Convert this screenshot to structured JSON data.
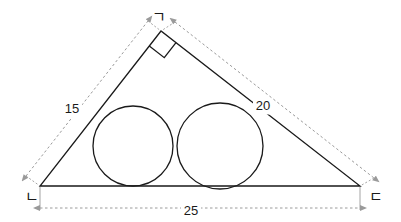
{
  "figure": {
    "kind": "geometry-diagram",
    "background_color": "#ffffff",
    "stroke_color": "#1a1a1a",
    "dimension_color": "#9a9a9a",
    "label_color": "#1a1a1a"
  },
  "triangle": {
    "vertices": [
      {
        "id": "apex",
        "label": "ㄱ",
        "x": 161,
        "y": 31,
        "label_x": 152,
        "label_y": 22
      },
      {
        "id": "bottom-left",
        "label": "ㄴ",
        "x": 40,
        "y": 186,
        "label_x": 25,
        "label_y": 202
      },
      {
        "id": "bottom-right",
        "label": "ㄷ",
        "x": 360,
        "y": 186,
        "label_x": 369,
        "label_y": 202
      }
    ],
    "right_angle_at": "apex",
    "right_angle_marker_size": 19
  },
  "circles": [
    {
      "id": "left-circle",
      "cx": 133,
      "cy": 146,
      "r": 40
    },
    {
      "id": "right-circle",
      "cx": 220,
      "cy": 146,
      "r": 43
    }
  ],
  "dimensions": [
    {
      "id": "side-left",
      "value": "15",
      "from_x": 26,
      "from_y": 176,
      "to_x": 148,
      "to_y": 21,
      "label_x": 72,
      "label_y": 110
    },
    {
      "id": "side-right",
      "value": "20",
      "from_x": 175,
      "from_y": 22,
      "to_x": 374,
      "to_y": 178,
      "label_x": 263,
      "label_y": 107
    },
    {
      "id": "base",
      "value": "25",
      "from_x": 40,
      "from_y": 208,
      "to_x": 360,
      "to_y": 208,
      "label_x": 191,
      "label_y": 212
    }
  ]
}
